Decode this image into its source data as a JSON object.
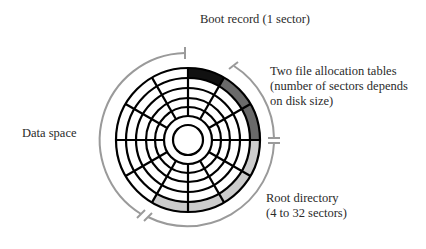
{
  "diagram": {
    "disk": {
      "rings": 5,
      "sectors_per_ring": 12,
      "outer_ring_regions": [
        {
          "name": "boot-record",
          "start_deg": 0,
          "end_deg": 30,
          "color": "#111111"
        },
        {
          "name": "file-allocation-tables",
          "start_deg": 30,
          "end_deg": 90,
          "color": "#6a6a6a"
        },
        {
          "name": "root-directory",
          "start_deg": 90,
          "end_deg": 210,
          "color": "#cccccc"
        },
        {
          "name": "data-space",
          "start_deg": 210,
          "end_deg": 360,
          "color": "#ffffff"
        }
      ]
    },
    "labels": {
      "boot_record": "Boot record (1 sector)",
      "fat": {
        "line1": "Two file allocation tables",
        "line2": "(number of sectors depends",
        "line3": "on disk size)"
      },
      "root_directory": {
        "line1": "Root directory",
        "line2": "(4 to 32 sectors)"
      },
      "data_space": "Data space"
    },
    "colors": {
      "outline": "#000000",
      "bracket_arc": "#9a9a9a",
      "boot": "#111111",
      "fat": "#6a6a6a",
      "root": "#cccccc"
    }
  }
}
